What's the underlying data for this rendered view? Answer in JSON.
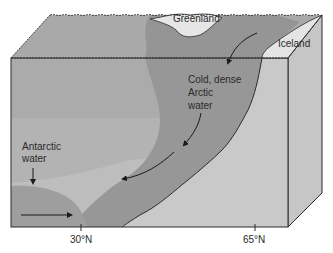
{
  "diagram": {
    "labels": {
      "greenland": "Greenland",
      "iceland": "Iceland",
      "arctic_water_line1": "Cold, dense",
      "arctic_water_line2": "Arctic",
      "arctic_water_line3": "water",
      "antarctic_water_line1": "Antarctic",
      "antarctic_water_line2": "water"
    },
    "axis": {
      "ticks": [
        {
          "label": "30°N"
        },
        {
          "label": "65°N"
        }
      ]
    },
    "colors": {
      "surface_gray": "#a8a8a8",
      "arctic_water": "#959595",
      "mid_water": "#b9b9b9",
      "antarctic_water": "#9d9d9d",
      "side_face": "#c4c4c4",
      "land": "#e6e6e6",
      "outline": "#2b2b2b"
    }
  }
}
